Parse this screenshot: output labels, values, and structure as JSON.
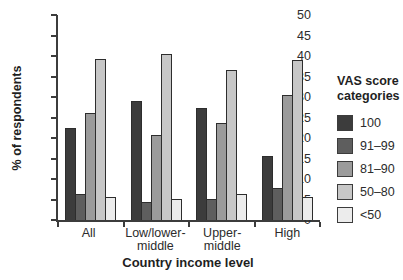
{
  "chart_data": {
    "type": "bar",
    "title": "",
    "xlabel": "Country income level",
    "ylabel": "% of respondents",
    "ylim": [
      0,
      50
    ],
    "yticks": [
      0,
      5,
      10,
      15,
      20,
      25,
      30,
      35,
      40,
      45,
      50
    ],
    "grid": false,
    "legend_position": "right",
    "legend_title": "VAS score categories",
    "categories": [
      "All",
      "Low/lower-middle",
      "Upper-middle",
      "High"
    ],
    "series": [
      {
        "name": "100",
        "color": "#3c3c3c",
        "values": [
          22.5,
          29.0,
          27.3,
          15.5
        ]
      },
      {
        "name": "91–99",
        "color": "#5e5e5e",
        "values": [
          6.3,
          4.4,
          5.2,
          7.8
        ]
      },
      {
        "name": "81–90",
        "color": "#9b9b9b",
        "values": [
          26.2,
          20.8,
          23.6,
          30.4
        ]
      },
      {
        "name": "50–80",
        "color": "#c7c7c7",
        "values": [
          39.2,
          40.6,
          36.5,
          39.0
        ]
      },
      {
        "name": "<50",
        "color": "#ececec",
        "values": [
          5.7,
          5.1,
          6.4,
          5.5
        ]
      }
    ]
  },
  "legend": {
    "title": "VAS score categories"
  }
}
